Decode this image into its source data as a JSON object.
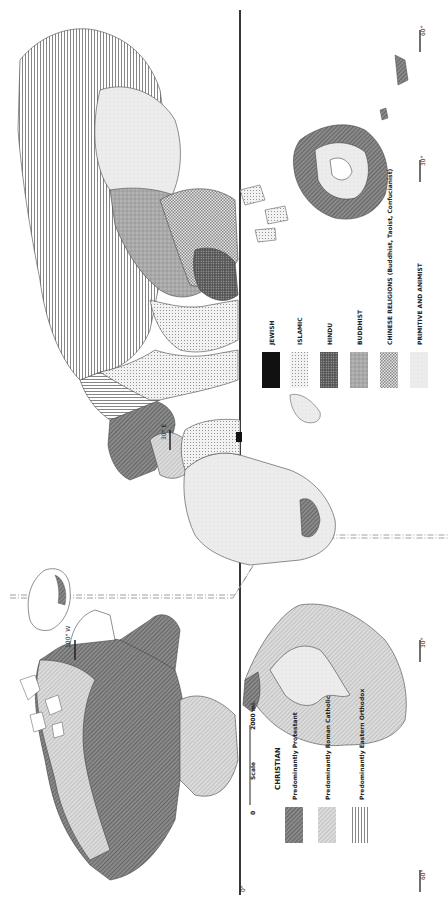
{
  "map": {
    "title": "World Religions",
    "orientation": "rotated 90 degrees clockwise",
    "meridians": [
      {
        "label": "100° W"
      },
      {
        "label": "30° E"
      }
    ],
    "latitudes": [
      {
        "label": "60°"
      },
      {
        "label": "30°"
      },
      {
        "label": "0°"
      },
      {
        "label": "30°"
      },
      {
        "label": "60°"
      }
    ],
    "scale": {
      "label": "Scale",
      "start": "0",
      "end": "2000 mi."
    },
    "legend": {
      "christian": {
        "heading": "CHRISTIAN",
        "items": [
          {
            "label": "Predominantly Protestant",
            "pattern": "dense-diagonal-dark"
          },
          {
            "label": "Predominantly Roman Catholic",
            "pattern": "diagonal-light"
          },
          {
            "label": "Predominantly Eastern Orthodox",
            "pattern": "vertical-lines"
          }
        ]
      },
      "other": [
        {
          "label": "JEWISH",
          "pattern": "solid-black"
        },
        {
          "label": "ISLAMIC",
          "pattern": "fine-dots"
        },
        {
          "label": "HINDU",
          "pattern": "coarse-dark-dots"
        },
        {
          "label": "BUDDHIST",
          "pattern": "mottled-gray"
        },
        {
          "label": "CHINESE RELIGIONS (Buddhist, Taoist, Confucianist)",
          "pattern": "checker-dots"
        },
        {
          "label": "PRIMITIVE AND ANIMIST",
          "pattern": "light-gray"
        }
      ]
    },
    "colors": {
      "ink": "#222222",
      "protestant": "#7a7a7a",
      "catholic": "#c9c9c9",
      "light": "#e8e8e8"
    }
  }
}
